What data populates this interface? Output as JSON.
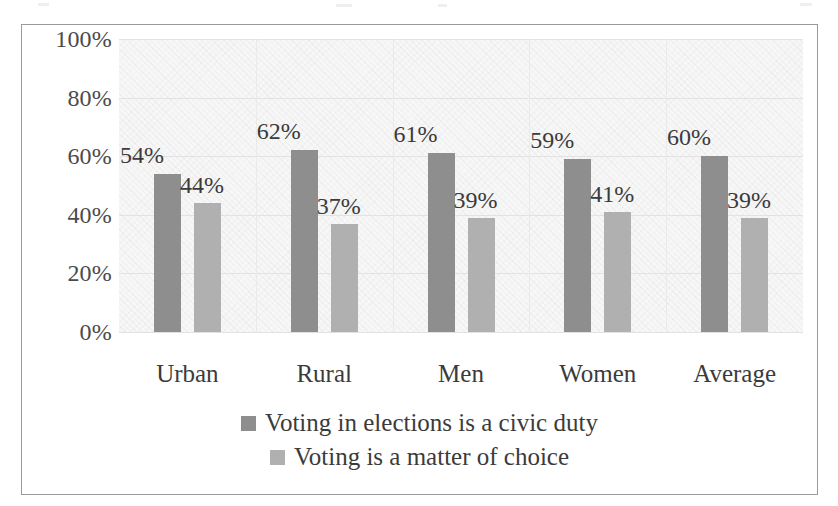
{
  "chart_data": {
    "type": "bar",
    "title": "",
    "subtitle": "",
    "xlabel": "",
    "ylabel": "",
    "categories": [
      "Urban",
      "Rural",
      "Men",
      "Women",
      "Average"
    ],
    "series": [
      {
        "name": "Voting in elections is a civic duty",
        "color": "#8e8e8e",
        "values": [
          54,
          62,
          61,
          59,
          60
        ],
        "labels": [
          "54%",
          "62%",
          "61%",
          "59%",
          "60%"
        ]
      },
      {
        "name": "Voting is a matter of choice",
        "color": "#b0b0b0",
        "values": [
          44,
          37,
          39,
          41,
          39
        ],
        "labels": [
          "44%",
          "37%",
          "39%",
          "41%",
          "39%"
        ]
      }
    ],
    "ylim": [
      0,
      100
    ],
    "ytick_values": [
      100,
      80,
      60,
      40,
      20,
      0
    ],
    "ytick_labels": [
      "100%",
      "80%",
      "60%",
      "40%",
      "20%",
      "0%"
    ],
    "grid": true,
    "legend_position": "bottom",
    "plot_background": "#f7f7f7",
    "frame_color": "#9a9a9a"
  }
}
